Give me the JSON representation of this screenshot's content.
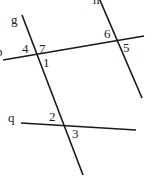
{
  "diagram": {
    "type": "transversal-lines",
    "line_color": "#1a1a1a",
    "lines": [
      {
        "name": "g",
        "x1": 22,
        "y1": 15,
        "x2": 83,
        "y2": 175
      },
      {
        "name": "h",
        "x1": 99,
        "y1": -2,
        "x2": 142,
        "y2": 98
      },
      {
        "name": "p",
        "x1": 3,
        "y1": 60,
        "x2": 144,
        "y2": 36
      },
      {
        "name": "q",
        "x1": 21,
        "y1": 123,
        "x2": 136,
        "y2": 130
      }
    ],
    "line_labels": {
      "g": "g",
      "h": "h",
      "p": "p",
      "q": "q"
    },
    "angle_labels": {
      "a1": "1",
      "a2": "2",
      "a3": "3",
      "a4": "4",
      "a5": "5",
      "a6": "6",
      "a7": "7"
    }
  }
}
